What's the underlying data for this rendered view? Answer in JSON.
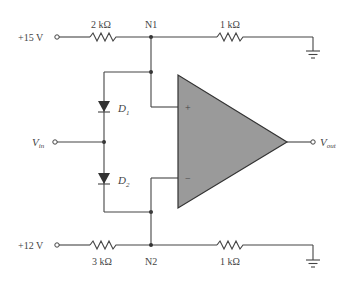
{
  "diagram": {
    "type": "circuit-schematic",
    "sources": [
      {
        "id": "v15",
        "label": "+15 V"
      },
      {
        "id": "v12",
        "label": "+12 V"
      }
    ],
    "resistors": [
      {
        "id": "r_top_left",
        "label": "2 kΩ",
        "between": [
          "+15 V",
          "N1"
        ]
      },
      {
        "id": "r_top_right",
        "label": "1 kΩ",
        "between": [
          "N1",
          "ground"
        ]
      },
      {
        "id": "r_bot_left",
        "label": "3 kΩ",
        "between": [
          "+12 V",
          "N2"
        ]
      },
      {
        "id": "r_bot_right",
        "label": "1 kΩ",
        "between": [
          "N2",
          "ground"
        ]
      }
    ],
    "nodes": [
      {
        "id": "n1",
        "label": "N1"
      },
      {
        "id": "n2",
        "label": "N2"
      }
    ],
    "diodes": [
      {
        "id": "d1",
        "label": "D",
        "sub": "1",
        "orientation": "anode N1 side, cathode Vin"
      },
      {
        "id": "d2",
        "label": "D",
        "sub": "2",
        "orientation": "anode Vin, cathode N2 side"
      }
    ],
    "input": {
      "label": "V",
      "sub": "in"
    },
    "output": {
      "label": "V",
      "sub": "out"
    },
    "opamp": {
      "plus": "+",
      "minus": "−",
      "fill": "#9a9a9a"
    }
  }
}
